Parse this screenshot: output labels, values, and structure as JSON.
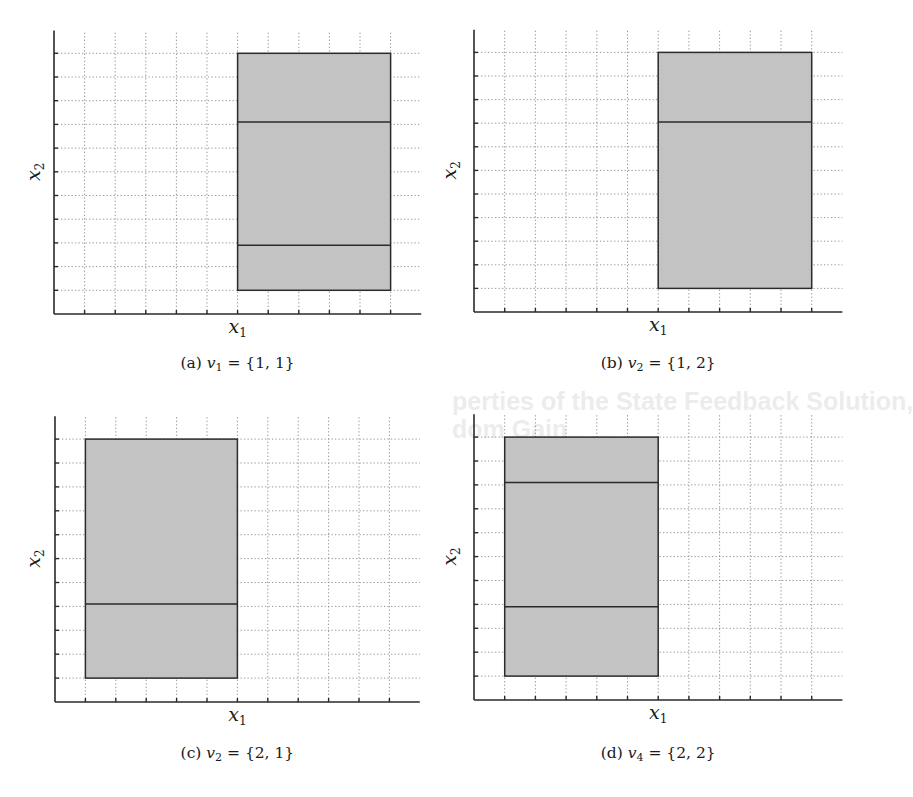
{
  "bleed_through": {
    "line1": "perties of the State Feedback Solution,",
    "line2": "dom Gain"
  },
  "chart_data": [
    {
      "id": "a",
      "type": "area",
      "title": "(a) v1 = {1,1}",
      "caption_prefix": "(a) ",
      "caption_var": "v",
      "caption_sub": "1",
      "caption_rest": " = {1, 1}",
      "xlabel": "x",
      "xlabel_sub": "1",
      "ylabel": "x",
      "ylabel_sub": "2",
      "grid": true,
      "xlim": [
        0,
        12
      ],
      "ylim": [
        0,
        12
      ],
      "xticks": [
        1,
        2,
        3,
        4,
        5,
        6,
        7,
        8,
        9,
        10,
        11
      ],
      "yticks": [
        1,
        2,
        3,
        4,
        5,
        6,
        7,
        8,
        9,
        10,
        11
      ],
      "region": {
        "x": [
          6,
          11
        ],
        "y": [
          1,
          11
        ]
      },
      "partition_lines_y": [
        8.1,
        2.9
      ]
    },
    {
      "id": "b",
      "type": "area",
      "title": "(b) v2 = {1,2}",
      "caption_prefix": "(b) ",
      "caption_var": "v",
      "caption_sub": "2",
      "caption_rest": " = {1, 2}",
      "xlabel": "x",
      "xlabel_sub": "1",
      "ylabel": "x",
      "ylabel_sub": "2",
      "grid": true,
      "xlim": [
        0,
        12
      ],
      "ylim": [
        0,
        12
      ],
      "xticks": [
        1,
        2,
        3,
        4,
        5,
        6,
        7,
        8,
        9,
        10,
        11
      ],
      "yticks": [
        1,
        2,
        3,
        4,
        5,
        6,
        7,
        8,
        9,
        10,
        11
      ],
      "region": {
        "x": [
          6,
          11
        ],
        "y": [
          1,
          11
        ]
      },
      "partition_lines_y": [
        8.05
      ]
    },
    {
      "id": "c",
      "type": "area",
      "title": "(c) v2 = {2,1}",
      "caption_prefix": "(c) ",
      "caption_var": "v",
      "caption_sub": "2",
      "caption_rest": " = {2, 1}",
      "xlabel": "x",
      "xlabel_sub": "1",
      "ylabel": "x",
      "ylabel_sub": "2",
      "grid": true,
      "xlim": [
        0,
        12
      ],
      "ylim": [
        0,
        12
      ],
      "xticks": [
        1,
        2,
        3,
        4,
        5,
        6,
        7,
        8,
        9,
        10,
        11
      ],
      "yticks": [
        1,
        2,
        3,
        4,
        5,
        6,
        7,
        8,
        9,
        10,
        11
      ],
      "region": {
        "x": [
          1,
          6
        ],
        "y": [
          1,
          11
        ]
      },
      "partition_lines_y": [
        4.1
      ]
    },
    {
      "id": "d",
      "type": "area",
      "title": "(d) v4 = {2,2}",
      "caption_prefix": "(d) ",
      "caption_var": "v",
      "caption_sub": "4",
      "caption_rest": " = {2, 2}",
      "xlabel": "x",
      "xlabel_sub": "1",
      "ylabel": "x",
      "ylabel_sub": "2",
      "grid": true,
      "xlim": [
        0,
        12
      ],
      "ylim": [
        0,
        12
      ],
      "xticks": [
        1,
        2,
        3,
        4,
        5,
        6,
        7,
        8,
        9,
        10,
        11
      ],
      "yticks": [
        1,
        2,
        3,
        4,
        5,
        6,
        7,
        8,
        9,
        10,
        11
      ],
      "region": {
        "x": [
          1,
          6
        ],
        "y": [
          1,
          11
        ]
      },
      "partition_lines_y": [
        9.1,
        3.9
      ]
    }
  ],
  "colors": {
    "region_fill": "#c3c3c3",
    "region_edge": "#2b2b2b",
    "grid": "#8a8a8a",
    "axis": "#2a2a2a"
  }
}
